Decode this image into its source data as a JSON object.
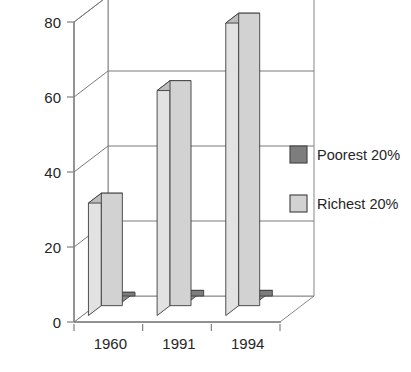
{
  "chart_data": {
    "type": "bar",
    "title": "",
    "subtitle": "",
    "xlabel": "",
    "ylabel": "",
    "categories": [
      "1960",
      "1991",
      "1994"
    ],
    "series": [
      {
        "name": "Poorest 20%",
        "values": [
          1,
          1.5,
          1.5
        ],
        "color": "#7d7d7d"
      },
      {
        "name": "Richest 20%",
        "values": [
          30,
          60,
          78
        ],
        "color": "#d2d2d2"
      }
    ],
    "ylim": [
      0,
      80
    ],
    "yticks": [
      0,
      20,
      40,
      60,
      80
    ],
    "ytick_labels": [
      "0",
      "20",
      "40",
      "60",
      "80"
    ],
    "grid": true,
    "grid_axis": "y",
    "legend": {
      "position": "right",
      "entries": [
        {
          "label": "Poorest 20%",
          "swatch_color": "#7d7d7d"
        },
        {
          "label": "Richest 20%",
          "swatch_color": "#d2d2d2"
        }
      ]
    },
    "style": {
      "three_d": true,
      "background": "#ffffff",
      "axis_color": "#808080",
      "frame_color": "#7a7a7a",
      "text_color": "#262626",
      "bar_front_dark": "#7d7d7d",
      "bar_front_light": "#d2d2d2",
      "bar_side_dark": "#9a9a9a",
      "bar_side_light": "#e2e2e2",
      "bar_top_dark": "#8e8e8e",
      "bar_top_light": "#bdbdbd",
      "bar_edge": "#3d3d3d"
    }
  },
  "axis": {
    "y_labels": [
      "80",
      "60",
      "40",
      "20",
      "0"
    ]
  },
  "categories": {
    "c0": "1960",
    "c1": "1991",
    "c2": "1994"
  },
  "legend": {
    "item0": "Poorest 20%",
    "item1": "Richest 20%"
  }
}
